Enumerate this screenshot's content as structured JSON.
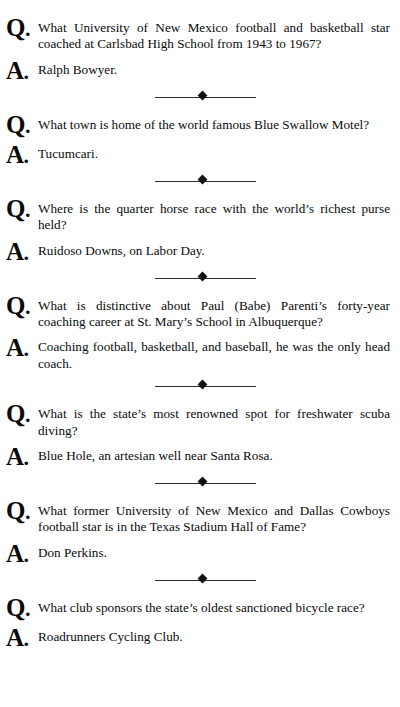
{
  "page": {
    "running_head": "",
    "question_marker": "Q",
    "answer_marker": "A",
    "marker_dot": ".",
    "divider_icon": "diamond-divider",
    "text_color": "#0a0a0a",
    "background_color": "#ffffff"
  },
  "entries": [
    {
      "question": "What University of New Mexico football and basketball star coached at Carlsbad High School from 1943 to 1967?",
      "answer": "Ralph Bowyer."
    },
    {
      "question": "What town is home of the world famous Blue Swallow Motel?",
      "answer": "Tucumcari."
    },
    {
      "question": "Where is the quarter horse race with the world’s richest purse held?",
      "answer": "Ruidoso Downs, on Labor Day."
    },
    {
      "question": "What is distinctive about Paul (Babe) Parenti’s forty-year coaching career at St. Mary’s School in Albuquerque?",
      "answer": "Coaching football, basketball, and baseball, he was the only head coach."
    },
    {
      "question": "What is the state’s most renowned spot for freshwater scuba diving?",
      "answer": "Blue Hole, an artesian well near Santa Rosa."
    },
    {
      "question": "What former University of New Mexico and Dallas Cowboys football star is in the Texas Stadium Hall of Fame?",
      "answer": "Don Perkins."
    },
    {
      "question": "What club sponsors the state’s oldest sanctioned bicycle race?",
      "answer": "Roadrunners Cycling Club."
    }
  ]
}
